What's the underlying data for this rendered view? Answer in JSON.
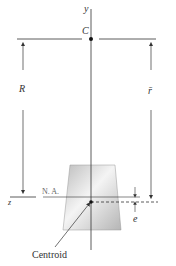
{
  "figure": {
    "labels": {
      "y_axis": "y",
      "z_axis": "z",
      "center": "C",
      "radius": "R",
      "rbar": "r̄",
      "neutral_axis": "N. A.",
      "eccentricity": "e",
      "centroid": "Centroid"
    },
    "colors": {
      "line": "#333333",
      "shape_light": "#f2f2f2",
      "shape_dark": "#b9b9b9"
    }
  }
}
